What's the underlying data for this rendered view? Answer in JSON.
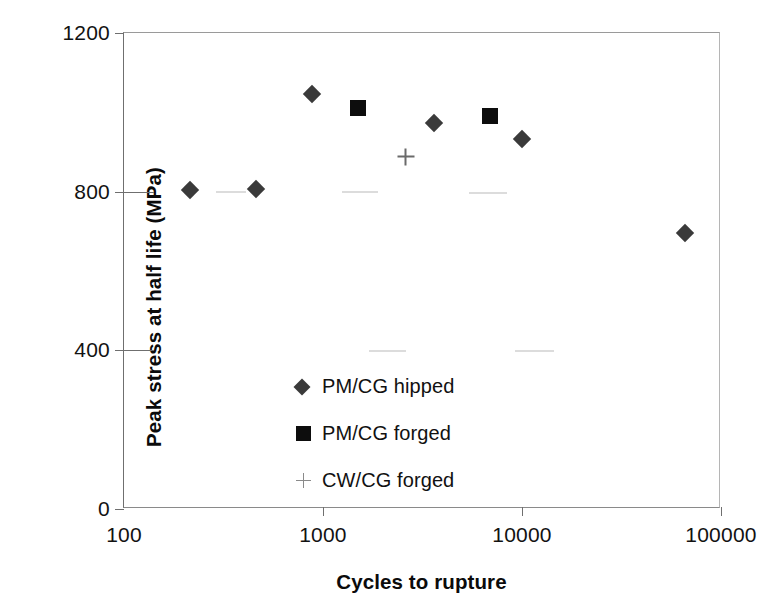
{
  "chart_data": {
    "type": "scatter",
    "title": "",
    "xlabel": "Cycles to rupture",
    "ylabel": "Peak stress at half life (MPa)",
    "xscale": "log",
    "xlim": [
      100,
      100000
    ],
    "ylim": [
      0,
      1200
    ],
    "xticks": [
      "100",
      "1000",
      "10000",
      "100000"
    ],
    "xtick_values": [
      100,
      1000,
      10000,
      100000
    ],
    "yticks": [
      "0",
      "400",
      "800",
      "1200"
    ],
    "ytick_values": [
      0,
      400,
      800,
      1200
    ],
    "grid": false,
    "legend_position": "inside-lower-left",
    "series": [
      {
        "name": "PM/CG hipped",
        "marker": "diamond",
        "color": "#3a3a3a",
        "points": [
          {
            "x": 215,
            "y": 805
          },
          {
            "x": 460,
            "y": 806
          },
          {
            "x": 880,
            "y": 1045
          },
          {
            "x": 3600,
            "y": 973
          },
          {
            "x": 10000,
            "y": 933
          },
          {
            "x": 66000,
            "y": 697
          }
        ]
      },
      {
        "name": "PM/CG forged",
        "marker": "square",
        "color": "#0d0d0d",
        "points": [
          {
            "x": 1500,
            "y": 1010
          },
          {
            "x": 6900,
            "y": 990
          }
        ]
      },
      {
        "name": "CW/CG forged",
        "marker": "plus",
        "color": "#6a6a6a",
        "points": [
          {
            "x": 2600,
            "y": 888
          }
        ]
      }
    ]
  },
  "artifacts": [
    {
      "x_start": 290,
      "x_end": 410,
      "y": 800
    },
    {
      "x_start": 1250,
      "x_end": 1900,
      "y": 798
    },
    {
      "x_start": 5400,
      "x_end": 8400,
      "y": 797
    },
    {
      "x_start": 1700,
      "x_end": 2600,
      "y": 399
    },
    {
      "x_start": 9200,
      "x_end": 14500,
      "y": 398
    }
  ]
}
